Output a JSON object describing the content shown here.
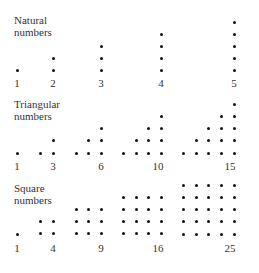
{
  "sections": [
    {
      "title_line1": "Natural",
      "title_line2": "numbers",
      "title_pos": [
        14,
        14
      ],
      "rows_y": [
        22,
        34,
        46,
        58,
        70
      ],
      "label_y": 77,
      "groups": [
        {
          "label": "1",
          "label_x": 17,
          "dots": [
            [
              17,
              70
            ]
          ]
        },
        {
          "label": "2",
          "label_x": 53,
          "dots": [
            [
              53,
              58
            ],
            [
              53,
              70
            ]
          ]
        },
        {
          "label": "3",
          "label_x": 101,
          "dots": [
            [
              101,
              46
            ],
            [
              101,
              58
            ],
            [
              101,
              70
            ]
          ]
        },
        {
          "label": "4",
          "label_x": 161,
          "dots": [
            [
              161,
              34
            ],
            [
              161,
              46
            ],
            [
              161,
              58
            ],
            [
              161,
              70
            ]
          ]
        },
        {
          "label": "5",
          "label_x": 234,
          "dots": [
            [
              234,
              22
            ],
            [
              234,
              34
            ],
            [
              234,
              46
            ],
            [
              234,
              58
            ],
            [
              234,
              70
            ]
          ]
        }
      ]
    },
    {
      "title_line1": "Triangular",
      "title_line2": "numbers",
      "title_pos": [
        14,
        98
      ],
      "label_y": 160,
      "groups": [
        {
          "label": "1",
          "label_x": 17,
          "dots": [
            [
              17,
              153
            ]
          ]
        },
        {
          "label": "3",
          "label_x": 53,
          "dots": [
            [
              53,
              140
            ],
            [
              40,
              153
            ],
            [
              53,
              153
            ]
          ]
        },
        {
          "label": "6",
          "label_x": 101,
          "dots": [
            [
              101,
              128
            ],
            [
              88,
              140
            ],
            [
              101,
              140
            ],
            [
              76,
              153
            ],
            [
              88,
              153
            ],
            [
              101,
              153
            ]
          ]
        },
        {
          "label": "10",
          "label_x": 158,
          "dots": [
            [
              161,
              116
            ],
            [
              148,
              128
            ],
            [
              161,
              128
            ],
            [
              136,
              140
            ],
            [
              148,
              140
            ],
            [
              161,
              140
            ],
            [
              123,
              153
            ],
            [
              136,
              153
            ],
            [
              148,
              153
            ],
            [
              161,
              153
            ]
          ]
        },
        {
          "label": "15",
          "label_x": 230,
          "dots": [
            [
              234,
              104
            ],
            [
              221,
              116
            ],
            [
              234,
              116
            ],
            [
              208,
              128
            ],
            [
              221,
              128
            ],
            [
              234,
              128
            ],
            [
              196,
              140
            ],
            [
              208,
              140
            ],
            [
              221,
              140
            ],
            [
              234,
              140
            ],
            [
              183,
              153
            ],
            [
              196,
              153
            ],
            [
              208,
              153
            ],
            [
              221,
              153
            ],
            [
              234,
              153
            ]
          ]
        }
      ]
    },
    {
      "title_line1": "Square",
      "title_line2": "numbers",
      "title_pos": [
        14,
        182
      ],
      "label_y": 242,
      "groups": [
        {
          "label": "1",
          "label_x": 17,
          "rows": 1,
          "cols": [
            17
          ],
          "top": 234
        },
        {
          "label": "4",
          "label_x": 53,
          "rows": 2,
          "cols": [
            40,
            53
          ],
          "top": 221
        },
        {
          "label": "9",
          "label_x": 101,
          "rows": 3,
          "cols": [
            76,
            88,
            101
          ],
          "top": 209
        },
        {
          "label": "16",
          "label_x": 158,
          "rows": 4,
          "cols": [
            123,
            136,
            148,
            161
          ],
          "top": 197
        },
        {
          "label": "25",
          "label_x": 230,
          "rows": 5,
          "cols": [
            183,
            196,
            208,
            221,
            234
          ],
          "top": 185
        }
      ],
      "row_step": 12.25
    }
  ]
}
